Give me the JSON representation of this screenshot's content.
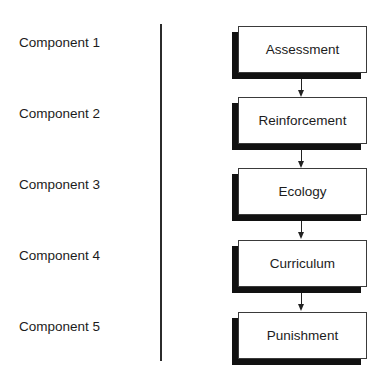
{
  "diagram": {
    "type": "flowchart",
    "orientation": "vertical",
    "labels": [
      {
        "text": "Component 1"
      },
      {
        "text": "Component 2"
      },
      {
        "text": "Component 3"
      },
      {
        "text": "Component 4"
      },
      {
        "text": "Component 5"
      }
    ],
    "nodes": [
      {
        "id": "assessment",
        "text": "Assessment"
      },
      {
        "id": "reinforcement",
        "text": "Reinforcement"
      },
      {
        "id": "ecology",
        "text": "Ecology"
      },
      {
        "id": "curriculum",
        "text": "Curriculum"
      },
      {
        "id": "punishment",
        "text": "Punishment"
      }
    ],
    "edges": [
      {
        "from": "assessment",
        "to": "reinforcement"
      },
      {
        "from": "reinforcement",
        "to": "ecology"
      },
      {
        "from": "ecology",
        "to": "curriculum"
      },
      {
        "from": "curriculum",
        "to": "punishment"
      }
    ],
    "colors": {
      "box_border": "#3a3a3a",
      "shadow": "#111111",
      "text": "#1c1c1c",
      "background": "#ffffff"
    }
  }
}
